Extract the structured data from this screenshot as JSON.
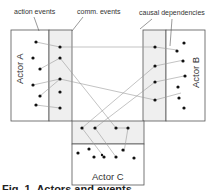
{
  "labels": {
    "action_events": "action events",
    "comm_events": "comm. events",
    "causal_dependencies": "causal dependencies"
  },
  "actors": {
    "a": "Actor A",
    "b": "Actor B",
    "c": "Actor C"
  },
  "caption": "Fig. 1. Actors and events",
  "colors": {
    "box_stroke": "#555555",
    "comm_fill": "#efefef",
    "dot": "#111111",
    "dependency_line": "#9a9a9a"
  }
}
